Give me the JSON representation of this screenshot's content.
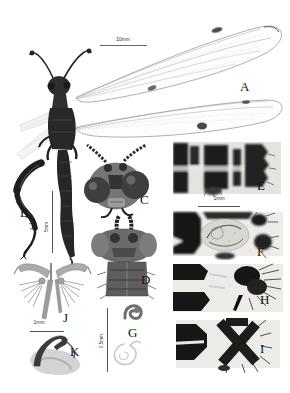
{
  "figure": {
    "labels": {
      "A": "A",
      "B": "B",
      "C": "C",
      "D": "D",
      "E": "E",
      "F": "F",
      "G": "G",
      "H": "H",
      "I": "I",
      "J": "J",
      "K": "K"
    },
    "scale_bars": {
      "wing": {
        "text": "10mm",
        "orientation": "horizontal"
      },
      "leg": {
        "text": "5mm",
        "orientation": "vertical"
      },
      "terminalia": {
        "text": "1mm",
        "orientation": "horizontal"
      },
      "gonarcus": {
        "text": "1mm",
        "orientation": "horizontal"
      },
      "spermatheca": {
        "text": "0.5mm",
        "orientation": "vertical"
      }
    }
  }
}
